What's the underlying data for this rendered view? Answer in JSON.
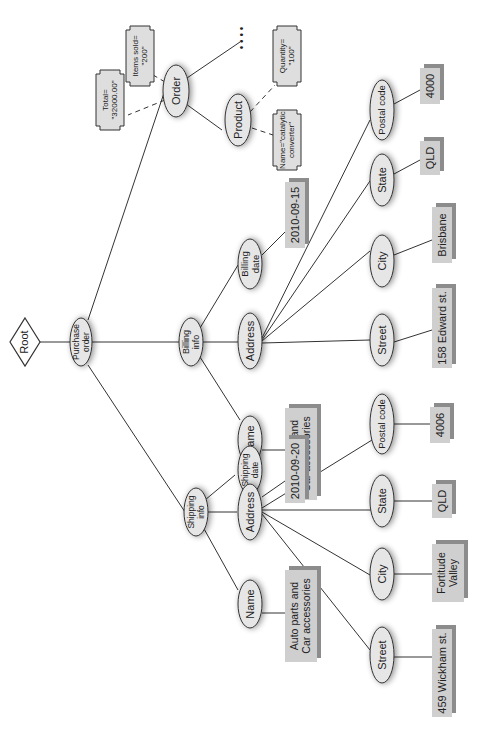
{
  "diagram": {
    "type": "xml-tree",
    "orientation": "rotated-90-ccw",
    "colors": {
      "node_fill": "#e6e6e6",
      "node_stroke": "#333333",
      "value_fill": "#cfcfcf",
      "value_shadow": "#8c8c8c",
      "line": "#333333"
    },
    "root": {
      "label": "Root"
    },
    "purchase_order": {
      "label": [
        "Purchase",
        "order"
      ]
    },
    "order": {
      "label": "Order",
      "attributes": [
        {
          "label": [
            "Total=",
            "\"32000.00\""
          ]
        },
        {
          "label": [
            "Items sold=",
            "\"200\""
          ]
        }
      ],
      "ellipsis": "• • • •",
      "product": {
        "label": "Product",
        "attributes": [
          {
            "label": [
              "Name=\"catalytic",
              "converter\""
            ]
          },
          {
            "label": [
              "Quantity=",
              "\"100\""
            ]
          }
        ]
      }
    },
    "billing_info": {
      "label": [
        "Billing",
        "info"
      ],
      "name": {
        "label": "Name",
        "value": [
          "Auto parts and",
          "Car accessories"
        ]
      },
      "date": {
        "label": [
          "Billing",
          "date"
        ],
        "value": "2010-09-15"
      },
      "address": {
        "label": "Address",
        "street": {
          "label": "Street",
          "value": "158 Edward st."
        },
        "city": {
          "label": "City",
          "value": "Brisbane"
        },
        "state": {
          "label": "State",
          "value": "QLD"
        },
        "postal": {
          "label": "Postal code",
          "value": "4000"
        }
      }
    },
    "shipping_info": {
      "label": [
        "Shipping",
        "info"
      ],
      "name": {
        "label": "Name",
        "value": [
          "Auto parts and",
          "Car accessories"
        ]
      },
      "date": {
        "label": [
          "Shipping",
          "date"
        ],
        "value": "2010-09-20"
      },
      "address": {
        "label": "Address",
        "street": {
          "label": "Street",
          "value": "459 Wickham st."
        },
        "city": {
          "label": "City",
          "value": [
            "Fortitude",
            "Valley"
          ]
        },
        "state": {
          "label": "State",
          "value": "QLD"
        },
        "postal": {
          "label": "Postal code",
          "value": "4006"
        }
      }
    }
  }
}
